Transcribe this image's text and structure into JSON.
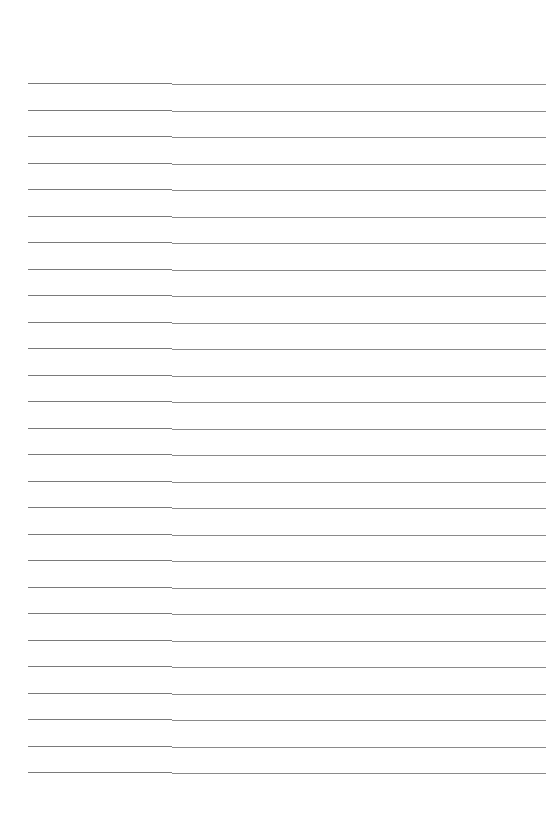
{
  "document": {
    "type": "lined-paper",
    "background_color": "#ffffff",
    "rule_color": "#7a7a7a",
    "rule_left": 28,
    "rule_right": 546,
    "rule_step_x": 172,
    "first_rule_y": 83,
    "rule_spacing": 26.5,
    "rule_count": 27
  }
}
